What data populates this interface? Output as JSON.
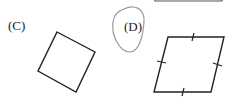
{
  "options": [
    {
      "label": "(C)",
      "shape": "square",
      "description": "tilted square"
    },
    {
      "label": "(D)",
      "shape": "rhombus",
      "description": "rhombus with tick marks on all four sides",
      "circled": true
    }
  ],
  "colors": {
    "stroke": "#222222",
    "circle": "#999999",
    "background": "#ffffff"
  }
}
